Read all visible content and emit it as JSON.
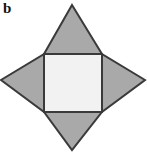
{
  "figure": {
    "panel_label": "b",
    "caption": "",
    "canvas": {
      "width": 147,
      "height": 154,
      "background_color": "#ffffff"
    },
    "colors": {
      "star_fill": "#a9a9a9",
      "inner_square_fill": "#f2f2f2",
      "stroke": "#3a3a3a",
      "label_color": "#111111"
    },
    "geometry": {
      "star_points": {
        "top": [
          72,
          5
        ],
        "right": [
          145,
          80
        ],
        "bottom": [
          72,
          150
        ],
        "left": [
          1,
          80
        ]
      },
      "inner_square": {
        "left": 44,
        "top": 54,
        "right": 102,
        "bottom": 112,
        "width": 58,
        "height": 58
      },
      "stroke_width": 2
    },
    "star_outline_path": "M 72,5 L 102,54 L 145,80 L 102,112 L 72,150 L 44,112 L 1,80 L 44,54 Z",
    "inner_square_path": "M 44,54 L 102,54 L 102,112 L 44,112 Z"
  }
}
